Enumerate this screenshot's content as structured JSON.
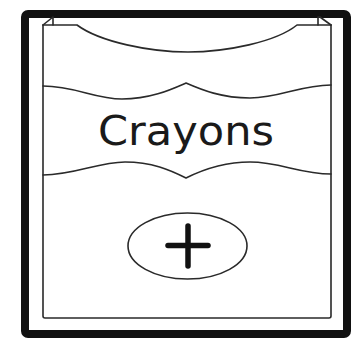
{
  "tile": {
    "title": "Crayons",
    "action_icon": "plus-icon",
    "colors": {
      "frame": "#111111",
      "line": "#2a2a2a",
      "background": "#ffffff",
      "text": "#1a1a1a"
    }
  }
}
